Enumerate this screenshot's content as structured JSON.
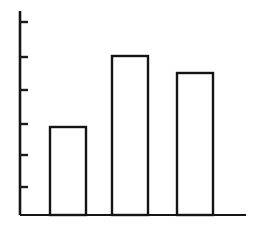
{
  "figure": {
    "name": "bar-chart-figure",
    "background_color": "#ffffff",
    "ink_color": "#141414",
    "width": 262,
    "height": 228,
    "style": "hand-drawn scanned line art, unlabeled outlined bars"
  },
  "axes": {
    "y_axis": {
      "label": "",
      "x_px": 20,
      "top_px": 11,
      "bottom_px": 215,
      "tick_count": 6,
      "tick_positions_px": [
        22,
        57,
        90,
        124,
        155,
        187
      ],
      "tick_length_px": 8,
      "tick_labels": []
    },
    "x_axis": {
      "label": "",
      "y_px": 215,
      "left_px": 20,
      "right_px": 246,
      "tick_count": 0,
      "tick_labels": []
    },
    "grid": "off",
    "legend": "none"
  },
  "chart_data": {
    "type": "bar",
    "title": "",
    "subtitle": "",
    "xlabel": "",
    "ylabel": "",
    "categories": [
      "1",
      "2",
      "3"
    ],
    "values": [
      2.7,
      4.8,
      4.3
    ],
    "ylim": [
      0,
      6
    ],
    "xlim": [
      0,
      7
    ],
    "grid": false,
    "legend_position": "none",
    "tick_values": [
      1,
      2,
      3,
      4,
      5,
      6
    ],
    "annotations": [],
    "bars": [
      {
        "category": "1",
        "value": 2.7,
        "left_px": 50,
        "right_px": 86,
        "top_px": 127,
        "bottom_px": 215,
        "fill": "#ffffff",
        "stroke": "#141414"
      },
      {
        "category": "2",
        "value": 4.8,
        "left_px": 112,
        "right_px": 148,
        "top_px": 56,
        "bottom_px": 215,
        "fill": "#ffffff",
        "stroke": "#141414"
      },
      {
        "category": "3",
        "value": 4.3,
        "left_px": 177,
        "right_px": 213,
        "top_px": 73,
        "bottom_px": 215,
        "fill": "#ffffff",
        "stroke": "#141414"
      }
    ]
  }
}
